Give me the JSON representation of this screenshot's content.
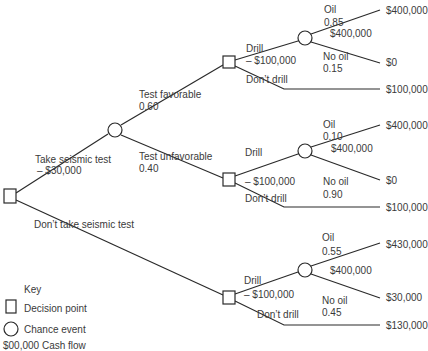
{
  "root": {
    "type": "decision"
  },
  "branches": {
    "take_test": {
      "label": "Take seismic test",
      "cost": "– $30,000"
    },
    "dont_take_test": {
      "label": "Don’t take seismic test"
    }
  },
  "test_outcomes": {
    "favorable": {
      "label": "Test favorable",
      "prob": "0.60"
    },
    "unfavorable": {
      "label": "Test unfavorable",
      "prob": "0.40"
    }
  },
  "subtrees": [
    {
      "name": "favorable",
      "drill": {
        "label": "Drill",
        "cost": "– $100,000"
      },
      "dont_drill": {
        "label": "Don’t drill",
        "payoff": "$100,000"
      },
      "oil": {
        "label": "Oil",
        "prob": "0.85",
        "value": "$400,000",
        "payoff": "$400,000"
      },
      "no_oil": {
        "label": "No oil",
        "prob": "0.15",
        "payoff": "$0"
      }
    },
    {
      "name": "unfavorable",
      "drill": {
        "label": "Drill",
        "cost": "– $100,000"
      },
      "dont_drill": {
        "label": "Don’t drill",
        "payoff": "$100,000"
      },
      "oil": {
        "label": "Oil",
        "prob": "0.10",
        "value": "$400,000",
        "payoff": "$400,000"
      },
      "no_oil": {
        "label": "No oil",
        "prob": "0.90",
        "payoff": "$0"
      }
    },
    {
      "name": "no_test",
      "drill": {
        "label": "Drill",
        "cost": "– $100,000"
      },
      "dont_drill": {
        "label": "Don’t drill",
        "payoff": "$130,000"
      },
      "oil": {
        "label": "Oil",
        "prob": "0.55",
        "value": "$400,000",
        "payoff": "$430,000"
      },
      "no_oil": {
        "label": "No oil",
        "prob": "0.45",
        "payoff": "$30,000"
      }
    }
  ],
  "key": {
    "title": "Key",
    "decision": "Decision point",
    "chance": "Chance event",
    "cash_flow": "$00,000 Cash flow"
  },
  "colors": {
    "line": "#2a2a2a",
    "text": "#3a3a3a",
    "background": "#ffffff"
  }
}
